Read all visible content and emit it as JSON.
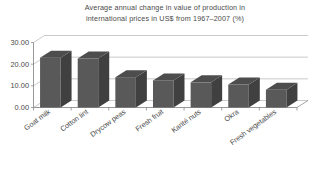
{
  "chart_data": {
    "type": "bar",
    "title": "Average annual change in value of production in\ninternational prices in US$ from 1967–2007 (%)",
    "subtitle": "",
    "xlabel": "",
    "ylabel": "",
    "categories": [
      "Goat milk",
      "Cotton lint",
      "Drycow peas",
      "Fresh fruit",
      "Karité nuts",
      "Okra",
      "Fresh vegetables"
    ],
    "values": [
      23.0,
      22.6,
      14.0,
      12.5,
      11.6,
      10.6,
      8.2
    ],
    "ylim": [
      0,
      30
    ],
    "yticks": [
      0,
      10,
      20,
      30
    ],
    "ytick_labels": [
      "0.00",
      "10.00",
      "20.00",
      "30.00"
    ],
    "grid": true,
    "legend": false,
    "legend_position": "none",
    "style": "3d-column",
    "bar_face_color": "#595959",
    "bar_side_color": "#404040",
    "bar_top_color": "#4d4d4d",
    "axis_color": "#8c8c8c",
    "grid_color": "#b3b3b3",
    "text_color": "#4a4a4a",
    "background_color": "#ffffff"
  },
  "title_lines": {
    "line1": "Average annual change in value of production in",
    "line2": "international prices in US$ from 1967–2007 (%)"
  }
}
